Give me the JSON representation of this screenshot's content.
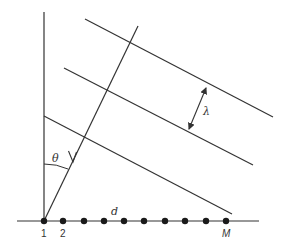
{
  "diagram": {
    "type": "uniform-linear-array-plane-wave",
    "colors": {
      "line": "#333333",
      "background": "#ffffff"
    },
    "labels": {
      "angle": "θ",
      "wavelength": "λ",
      "spacing": "d",
      "element_first": "1",
      "element_second": "2",
      "element_last": "M"
    },
    "array": {
      "element_count_drawn": 10,
      "element_x": [
        44,
        63,
        84,
        104,
        124,
        144,
        165,
        185,
        206,
        226
      ],
      "baseline_y": 221
    },
    "wavefronts": [
      {
        "x1": 85,
        "y1": 19,
        "x2": 273,
        "y2": 117
      },
      {
        "x1": 64,
        "y1": 68,
        "x2": 253,
        "y2": 165
      },
      {
        "x1": 44,
        "y1": 116,
        "x2": 232,
        "y2": 214
      }
    ],
    "ray": {
      "x1": 138,
      "y1": 26,
      "x2": 44,
      "y2": 221
    }
  }
}
